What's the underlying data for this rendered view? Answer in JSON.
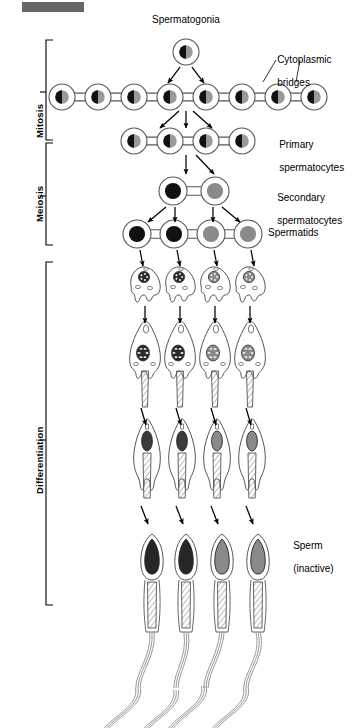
{
  "figure": {
    "title_bar": {
      "name": "top-gray-bar",
      "color": "#666666",
      "x": 22,
      "y": 2,
      "w": 62,
      "h": 10
    },
    "background": "#ffffff",
    "ink": "#000000",
    "outline": "#555555",
    "nucleus_dark": "#111111",
    "nucleus_gray": "#808080",
    "nucleus_half_gray": "#8a8a8a"
  },
  "stage_labels": [
    {
      "name": "stage-label-mitosis",
      "text": "Mitosis",
      "x": 27,
      "y": 113,
      "bracket": {
        "x": 46,
        "top": 40,
        "bottom": 140,
        "tick": 92
      }
    },
    {
      "name": "stage-label-meiosis",
      "text": "Meiosis",
      "x": 27,
      "y": 197,
      "bracket": {
        "x": 46,
        "top": 143,
        "bottom": 245,
        "tick": 196
      }
    },
    {
      "name": "stage-label-differentiation",
      "text": "Differentiation",
      "x": 27,
      "y": 505,
      "bracket": {
        "x": 46,
        "top": 262,
        "bottom": 605,
        "tick": 440
      }
    }
  ],
  "callout_labels": [
    {
      "name": "label-spermatogonia",
      "text": "Spermatogonia",
      "x": 152,
      "y": 14
    },
    {
      "name": "label-cytoplasmic-bridges",
      "line1": "Cytoplasmic",
      "line2": "bridges",
      "x": 266,
      "y": 42
    },
    {
      "name": "label-primary-spermatocytes",
      "line1": "Primary",
      "line2": "spermatocytes",
      "x": 268,
      "y": 127
    },
    {
      "name": "label-secondary-spermatocytes",
      "line1": "Secondary",
      "line2": "spermatocytes",
      "x": 266,
      "y": 180
    },
    {
      "name": "label-spermatids",
      "line1": "Spermatids",
      "line2": "",
      "x": 268,
      "y": 227
    },
    {
      "name": "label-sperm-inactive",
      "line1": "Sperm",
      "line2": "(inactive)",
      "x": 282,
      "y": 528
    }
  ],
  "chart_data": {
    "type": "diagram",
    "rows": [
      {
        "name": "row-spermatogonia",
        "label": "Spermatogonia",
        "stage": "Mitosis",
        "cell_count": 1,
        "y": 52,
        "cell_radius": 13,
        "nucleus_style": "half-black-half-gray",
        "xs": [
          186
        ]
      },
      {
        "name": "row-mitotic-chain",
        "label": "Cytoplasmic bridges",
        "stage": "Mitosis",
        "cell_count": 8,
        "y": 97,
        "cell_radius": 13,
        "nucleus_style": "half-black-half-gray",
        "xs": [
          62,
          98,
          134,
          170,
          206,
          242,
          278,
          314
        ]
      },
      {
        "name": "row-primary-spermatocytes",
        "label": "Primary spermatocytes",
        "stage": "Mitosis/Meiosis boundary",
        "cell_count": 4,
        "y": 141,
        "cell_radius": 13,
        "nucleus_style": "half-black-half-gray",
        "xs": [
          134,
          170,
          206,
          242
        ]
      },
      {
        "name": "row-secondary-spermatocytes",
        "label": "Secondary spermatocytes",
        "stage": "Meiosis",
        "cell_count": 2,
        "y": 191,
        "cell_radius": 14,
        "nucleus_style": "solid",
        "nucleus_fills": [
          "#111111",
          "#8a8a8a"
        ],
        "xs": [
          173,
          215
        ]
      },
      {
        "name": "row-spermatids",
        "label": "Spermatids",
        "stage": "Meiosis",
        "cell_count": 4,
        "y": 234,
        "cell_radius": 14,
        "nucleus_style": "solid",
        "nucleus_fills": [
          "#111111",
          "#111111",
          "#8a8a8a",
          "#8a8a8a"
        ],
        "xs": [
          137,
          174,
          211,
          248
        ]
      },
      {
        "name": "row-early-differentiation",
        "label": "Early differentiating spermatids",
        "stage": "Differentiation",
        "cell_count": 4,
        "y": 282,
        "nucleus_style": "speckled",
        "nucleus_fills": [
          "#2a2a2a",
          "#2a2a2a",
          "#8a8a8a",
          "#8a8a8a"
        ],
        "xs": [
          145,
          180,
          215,
          250
        ]
      },
      {
        "name": "row-mid-differentiation",
        "label": "Elongating spermatids with flagella",
        "stage": "Differentiation",
        "cell_count": 4,
        "y": 355,
        "nucleus_style": "speckled",
        "nucleus_fills": [
          "#2a2a2a",
          "#2a2a2a",
          "#8a8a8a",
          "#8a8a8a"
        ],
        "xs": [
          145,
          180,
          215,
          250
        ]
      },
      {
        "name": "row-late-differentiation",
        "label": "Late spermatids with hatched midpiece",
        "stage": "Differentiation",
        "cell_count": 4,
        "y": 450,
        "nucleus_style": "oval",
        "nucleus_fills": [
          "#3a3a3a",
          "#3a3a3a",
          "#8a8a8a",
          "#8a8a8a"
        ],
        "xs": [
          147,
          182,
          217,
          252
        ]
      },
      {
        "name": "row-sperm",
        "label": "Sperm (inactive)",
        "stage": "Differentiation",
        "cell_count": 4,
        "y": 560,
        "nucleus_style": "teardrop",
        "nucleus_fills": [
          "#262626",
          "#262626",
          "#8a8a8a",
          "#8a8a8a"
        ],
        "xs": [
          152,
          186,
          222,
          258
        ]
      }
    ],
    "arrow_groups": [
      {
        "name": "arrows-spermatogonia-to-chain",
        "count": 2,
        "from_y": 66,
        "to_y": 84
      },
      {
        "name": "arrows-chain-to-primary",
        "count": 3,
        "from_y": 110,
        "to_y": 128
      },
      {
        "name": "arrows-primary-to-secondary",
        "count": 2,
        "from_y": 154,
        "to_y": 176
      },
      {
        "name": "arrows-secondary-to-spermatids",
        "count": 4,
        "from_y": 205,
        "to_y": 221
      },
      {
        "name": "arrows-spermatids-to-early",
        "count": 4,
        "from_y": 248,
        "to_y": 266
      },
      {
        "name": "arrows-early-to-mid",
        "count": 4,
        "from_y": 310,
        "to_y": 328
      },
      {
        "name": "arrows-mid-to-late",
        "count": 4,
        "from_y": 405,
        "to_y": 425
      },
      {
        "name": "arrows-late-to-sperm",
        "count": 4,
        "from_y": 505,
        "to_y": 527
      }
    ]
  }
}
